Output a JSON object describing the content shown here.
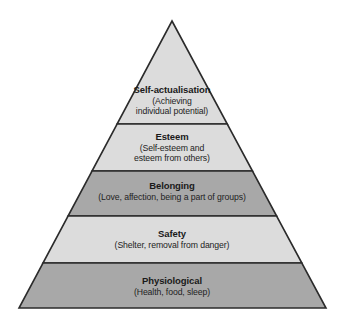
{
  "diagram": {
    "type": "pyramid",
    "name": "hierarchy-of-needs-pyramid",
    "background_color": "#ffffff",
    "outline_color": "#2b2b2b",
    "fill_light": "#dcdcdc",
    "fill_dark": "#a8a8a8",
    "text_color": "#1a1a1a",
    "apex": {
      "x": 172,
      "y": 21
    },
    "base_left": {
      "x": 19,
      "y": 308
    },
    "base_right": {
      "x": 326,
      "y": 308
    },
    "divider_y": [
      124,
      171,
      216,
      263
    ],
    "tiers": [
      {
        "level": 1,
        "title": "Self-actualisation",
        "description_lines": [
          "(Achieving",
          "individual potential)"
        ],
        "fill": "#dcdcdc"
      },
      {
        "level": 2,
        "title": "Esteem",
        "description_lines": [
          "(Self-esteem and",
          "esteem from others)"
        ],
        "fill": "#dcdcdc"
      },
      {
        "level": 3,
        "title": "Belonging",
        "description_lines": [
          "(Love, affection, being a part of groups)"
        ],
        "fill": "#a8a8a8"
      },
      {
        "level": 4,
        "title": "Safety",
        "description_lines": [
          "(Shelter, removal from danger)"
        ],
        "fill": "#dcdcdc"
      },
      {
        "level": 5,
        "title": "Physiological",
        "description_lines": [
          "(Health, food, sleep)"
        ],
        "fill": "#a8a8a8"
      }
    ]
  }
}
